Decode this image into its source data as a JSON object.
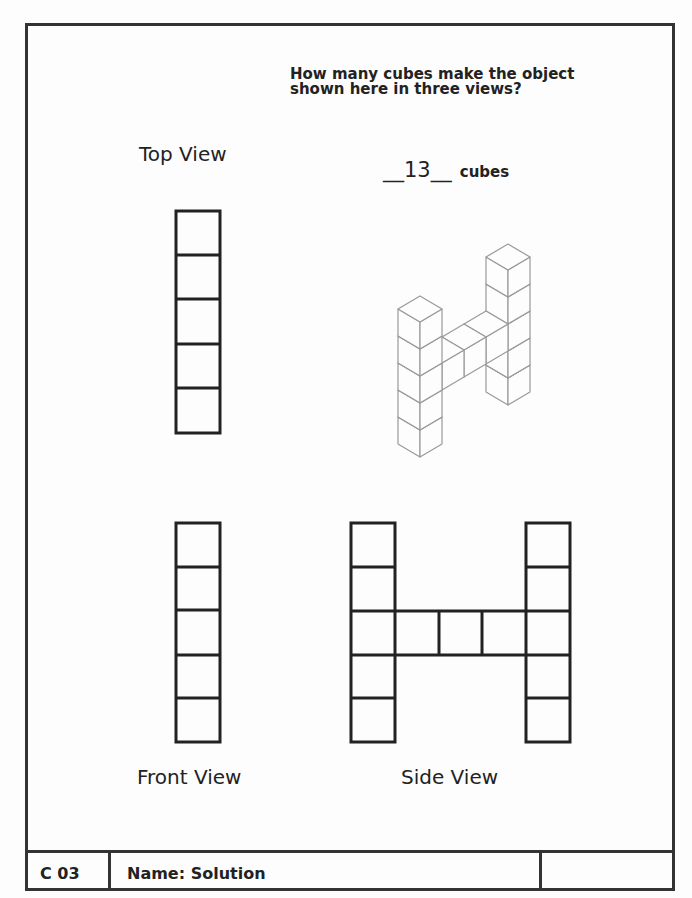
{
  "question": {
    "line1": "How many cubes make the object",
    "line2": "shown here in three views?"
  },
  "answer": {
    "value": "__13__",
    "unit": "cubes"
  },
  "views": {
    "top": {
      "label": "Top View",
      "cells": 5
    },
    "front": {
      "label": "Front View",
      "cells": 5
    },
    "side": {
      "label": "Side View",
      "left_column": 5,
      "bridge": 3,
      "right_column": 5
    }
  },
  "isometric": {
    "left_tower_height": 5,
    "right_tower_height": 5,
    "bridge_cubes": 3,
    "bridge_level": 3
  },
  "footer": {
    "code": "C 03",
    "name_label": "Name:",
    "name_value": "Solution",
    "right_box": ""
  },
  "colors": {
    "ink": "#222222",
    "iso_line": "#9a9a9a",
    "paper": "#fdfdfd"
  }
}
